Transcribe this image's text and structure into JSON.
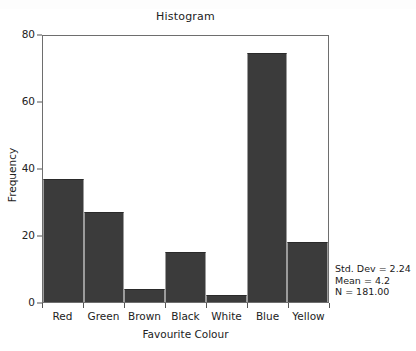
{
  "chart_data": {
    "type": "bar",
    "title": "Histogram",
    "xlabel": "Favourite Colour",
    "ylabel": "Frequency",
    "categories": [
      "Red",
      "Green",
      "Brown",
      "Black",
      "White",
      "Blue",
      "Yellow"
    ],
    "values": [
      37,
      27,
      4,
      15,
      2,
      75,
      18
    ],
    "ylim": [
      0,
      80
    ],
    "yticks": [
      0,
      20,
      40,
      60,
      80
    ],
    "ytick_labels": [
      "0",
      "20",
      "40",
      "60",
      "80"
    ],
    "grid": false,
    "legend": null,
    "bar_color": "#3b3b3b",
    "bars_contiguous": true,
    "annotations": {
      "std_dev": "Std. Dev = 2.24",
      "mean": "Mean = 4.2",
      "n": "N = 181.00"
    }
  },
  "figure": {
    "title": "Histogram",
    "axis_color": "#6e6e6e",
    "background": "#ffffff"
  }
}
